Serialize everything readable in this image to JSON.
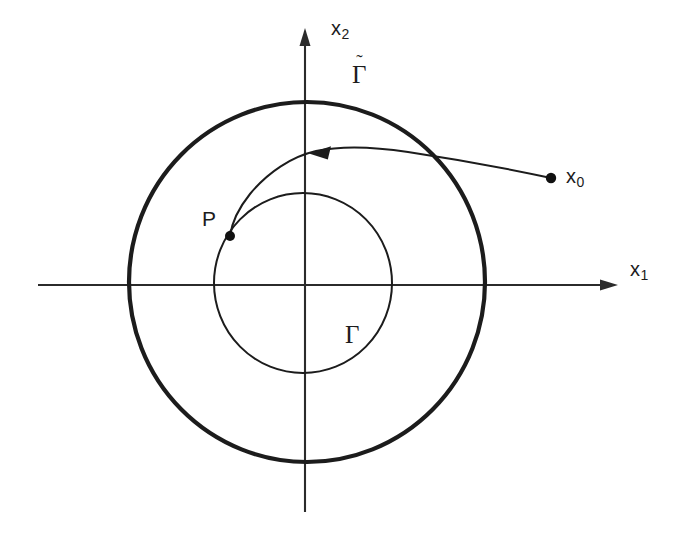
{
  "figure": {
    "kind": "phase-plane-diagram",
    "background_color": "#ffffff",
    "ink_color": "#1c1c1c",
    "width": 677,
    "height": 535
  },
  "axes": {
    "horizontal": {
      "name": "x1",
      "label_base": "x",
      "label_sub": "1",
      "y": 285,
      "x_start": 38,
      "x_end": 618,
      "arrow": "right"
    },
    "vertical": {
      "name": "x2",
      "label_base": "x",
      "label_sub": "2",
      "x": 305,
      "y_start": 512,
      "y_end": 28,
      "arrow": "up"
    },
    "origin": {
      "x": 305,
      "y": 285
    }
  },
  "curves": [
    {
      "id": "outer-cycle",
      "label": "Γ",
      "label_has_tilde": true,
      "tilde_glyph": "˜",
      "style": "thick",
      "shape": "ellipse",
      "center": {
        "x": 307,
        "y": 282
      },
      "rx": 178,
      "ry": 180,
      "label_pos": {
        "x": 352,
        "y": 62
      }
    },
    {
      "id": "inner-cycle",
      "label": "Γ",
      "label_has_tilde": false,
      "style": "thin",
      "shape": "ellipse",
      "center": {
        "x": 303,
        "y": 283
      },
      "rx": 89,
      "ry": 90,
      "label_pos": {
        "x": 345,
        "y": 322
      }
    }
  ],
  "trajectory": {
    "id": "orbit-from-x0",
    "description": "curve spiralling inward from x0 to P",
    "stroke": "thin",
    "start_point": {
      "x": 551,
      "y": 178
    },
    "end_point": {
      "x": 230,
      "y": 236
    },
    "arrow_at": {
      "x": 312,
      "y": 152
    },
    "arrow_direction": "left"
  },
  "points": [
    {
      "id": "x0",
      "label_base": "x",
      "label_sub": "0",
      "dot": {
        "x": 551,
        "y": 178,
        "r": 5.2
      },
      "label_pos": {
        "x": 566,
        "y": 166
      }
    },
    {
      "id": "P",
      "label_base": "P",
      "label_sub": "",
      "dot": {
        "x": 230,
        "y": 236,
        "r": 5.0
      },
      "label_pos": {
        "x": 202,
        "y": 208
      }
    }
  ]
}
